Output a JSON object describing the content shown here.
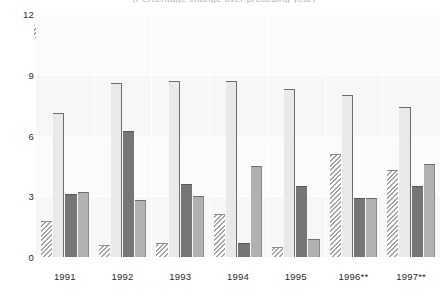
{
  "chart_data": {
    "type": "bar",
    "title": "(Percentage change over preceding year)",
    "xlabel": "",
    "ylabel": "",
    "ylim": [
      0,
      12
    ],
    "yticks": [
      0,
      3,
      6,
      9,
      12
    ],
    "grid": true,
    "legend_position": "top",
    "categories": [
      "1991",
      "1992",
      "1993",
      "1994",
      "1995",
      "1996**",
      "1997**"
    ],
    "series": [
      {
        "name": "Africa",
        "color": "#a3a3a3",
        "pattern": "diagonal-hatch",
        "values": [
          1.8,
          0.6,
          0.7,
          2.1,
          0.5,
          5.1,
          4.3
        ]
      },
      {
        "name": "Asia",
        "color": "#e9e9e7",
        "pattern": "solid",
        "values": [
          7.1,
          8.6,
          8.7,
          8.7,
          8.3,
          8.0,
          7.4
        ]
      },
      {
        "name": "Near East",
        "color": "#767676",
        "pattern": "solid",
        "values": [
          3.1,
          6.2,
          3.6,
          0.7,
          3.5,
          2.9,
          3.5
        ]
      },
      {
        "name": "Latin America",
        "color": "#b1b1b1",
        "pattern": "solid",
        "values": [
          3.2,
          2.8,
          3.0,
          4.5,
          0.9,
          2.9,
          4.6
        ]
      }
    ]
  },
  "legend": {
    "items": [
      {
        "label": "Africa"
      },
      {
        "label": "Asia"
      },
      {
        "label": "Near East"
      },
      {
        "label": "Latin America"
      }
    ]
  },
  "yaxis": {
    "ticks": [
      "0",
      "3",
      "6",
      "9",
      "12"
    ]
  },
  "xaxis": {
    "ticks": [
      "1991",
      "1992",
      "1993",
      "1994",
      "1995",
      "1996**",
      "1997**"
    ]
  }
}
